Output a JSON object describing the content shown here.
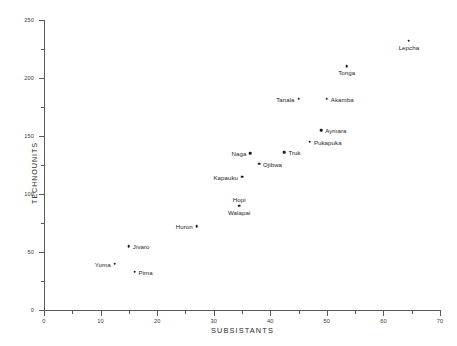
{
  "chart_data": {
    "type": "scatter",
    "title": "",
    "xlabel": "SUBSISTANTS",
    "ylabel": "TECHNOUNITS",
    "xlim": [
      0,
      70
    ],
    "ylim": [
      0,
      250
    ],
    "x_ticks_major": [
      0,
      10,
      20,
      30,
      40,
      50,
      60,
      70
    ],
    "y_ticks_major": [
      0,
      50,
      100,
      150,
      200,
      250
    ],
    "x_tick_step_minor": 5,
    "y_tick_step_minor": 25,
    "grid": false,
    "legend": "none",
    "points": [
      {
        "label": "Lepcha",
        "x": 64.5,
        "y": 232,
        "label_pos": "below"
      },
      {
        "label": "Tonga",
        "x": 53.5,
        "y": 210,
        "label_pos": "below"
      },
      {
        "label": "Akamba",
        "x": 50.0,
        "y": 182,
        "label_pos": "right"
      },
      {
        "label": "Tanala",
        "x": 45.0,
        "y": 182,
        "label_pos": "left"
      },
      {
        "label": "Aymara",
        "x": 49.0,
        "y": 155,
        "label_pos": "right"
      },
      {
        "label": "Pukapuka",
        "x": 47.0,
        "y": 145,
        "label_pos": "right"
      },
      {
        "label": "Truk",
        "x": 42.5,
        "y": 136,
        "label_pos": "right"
      },
      {
        "label": "Naga",
        "x": 36.5,
        "y": 135,
        "label_pos": "left"
      },
      {
        "label": "Ojibwa",
        "x": 38.0,
        "y": 126,
        "label_pos": "right"
      },
      {
        "label": "Kapauku",
        "x": 35.0,
        "y": 115,
        "label_pos": "left"
      },
      {
        "label": "Hopi",
        "x": 34.5,
        "y": 90,
        "label_pos": "above"
      },
      {
        "label": "Walapai",
        "x": 34.5,
        "y": 90,
        "label_pos": "below"
      },
      {
        "label": "Huron",
        "x": 27.0,
        "y": 72,
        "label_pos": "left"
      },
      {
        "label": "Jivaro",
        "x": 15.0,
        "y": 55,
        "label_pos": "right"
      },
      {
        "label": "Yuma",
        "x": 12.5,
        "y": 40,
        "label_pos": "left"
      },
      {
        "label": "Pima",
        "x": 16.0,
        "y": 33,
        "label_pos": "right"
      }
    ]
  }
}
